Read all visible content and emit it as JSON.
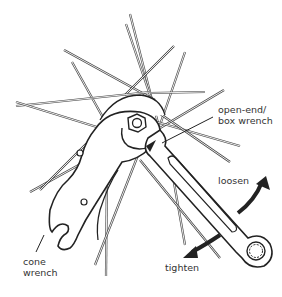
{
  "diagram": {
    "labels": {
      "open_end_box_wrench": "open-end/\nbox wrench",
      "cone_wrench": "cone\nwrench",
      "loosen": "loosen",
      "tighten": "tighten"
    },
    "colors": {
      "line": "#222222",
      "background": "#ffffff",
      "text": "#333333"
    }
  }
}
